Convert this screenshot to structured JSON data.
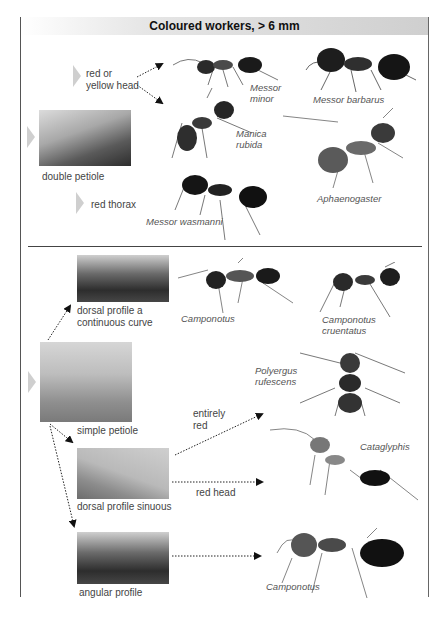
{
  "header": {
    "title": "Coloured workers, > 6 mm"
  },
  "colors": {
    "frame": "#555555",
    "header_gradient_end": "#cfcfcf",
    "chevron": "#cfcfcf",
    "text": "#444444"
  },
  "upper_section": {
    "key_label": "double petiole",
    "branches": [
      {
        "label_line1": "red or",
        "label_line2": "yellow head"
      },
      {
        "label": "red thorax"
      }
    ],
    "species": [
      {
        "line1": "Messor",
        "line2": "minor"
      },
      {
        "name": "Messor barbarus"
      },
      {
        "line1": "Manica",
        "line2": "rubida"
      },
      {
        "name": "Aphaenogaster"
      },
      {
        "name": "Messor wasmanni"
      }
    ]
  },
  "lower_section": {
    "key_label": "simple petiole",
    "branches": [
      {
        "line1": "dorsal profile a",
        "line2": "continuous curve"
      },
      {
        "label": "dorsal profile sinuous"
      },
      {
        "label": "angular profile"
      }
    ],
    "sub_branches": [
      {
        "line1": "entirely",
        "line2": "red"
      },
      {
        "label": "red head"
      }
    ],
    "species": [
      {
        "name": "Camponotus"
      },
      {
        "line1": "Camponotus",
        "line2": "cruentatus"
      },
      {
        "line1": "Polyergus",
        "line2": "rufescens"
      },
      {
        "name": "Cataglyphis"
      },
      {
        "name": "Camponotus"
      }
    ]
  }
}
